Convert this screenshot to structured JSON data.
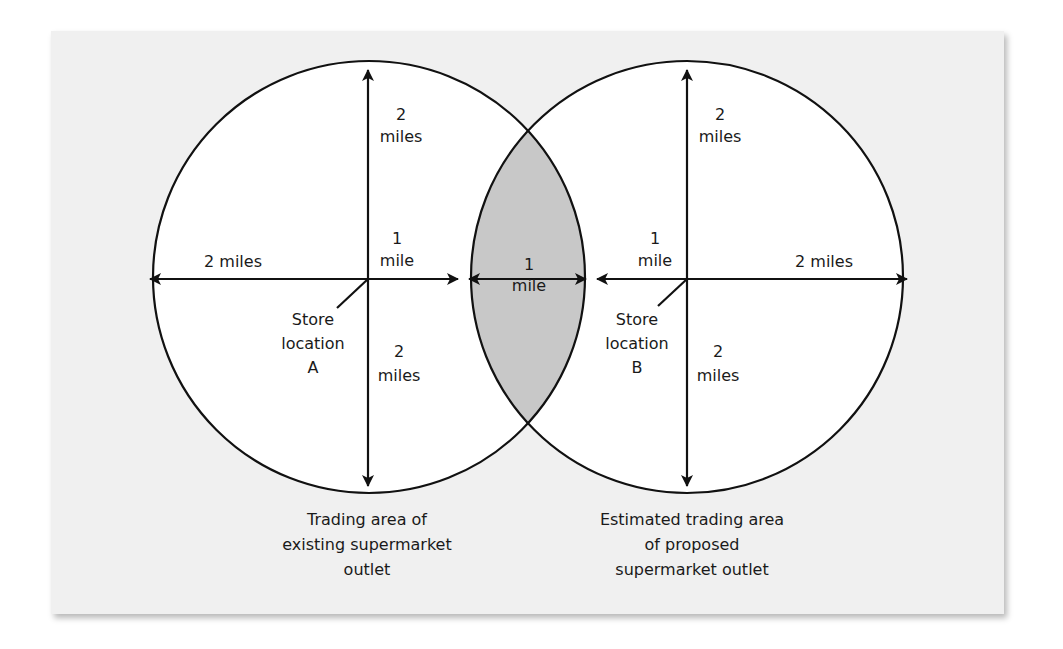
{
  "diagram": {
    "title": "",
    "colors": {
      "panel_bg": "#f0f0f0",
      "circle_fill": "#ffffff",
      "overlap_fill": "#c8c8c8",
      "stroke": "#111111"
    },
    "left_circle": {
      "store_label": [
        "Store",
        "location",
        "A"
      ],
      "top_label": [
        "2",
        "miles"
      ],
      "bottom_label": [
        "2",
        "miles"
      ],
      "left_label": "2 miles",
      "right_label": [
        "1",
        "mile"
      ],
      "caption": [
        "Trading area of",
        "existing supermarket",
        "outlet"
      ]
    },
    "right_circle": {
      "store_label": [
        "Store",
        "location",
        "B"
      ],
      "top_label": [
        "2",
        "miles"
      ],
      "bottom_label": [
        "2",
        "miles"
      ],
      "right_label": "2 miles",
      "left_label": [
        "1",
        "mile"
      ],
      "caption": [
        "Estimated trading area",
        "of proposed",
        "supermarket outlet"
      ]
    },
    "overlap": {
      "label": [
        "1",
        "mile"
      ]
    }
  }
}
